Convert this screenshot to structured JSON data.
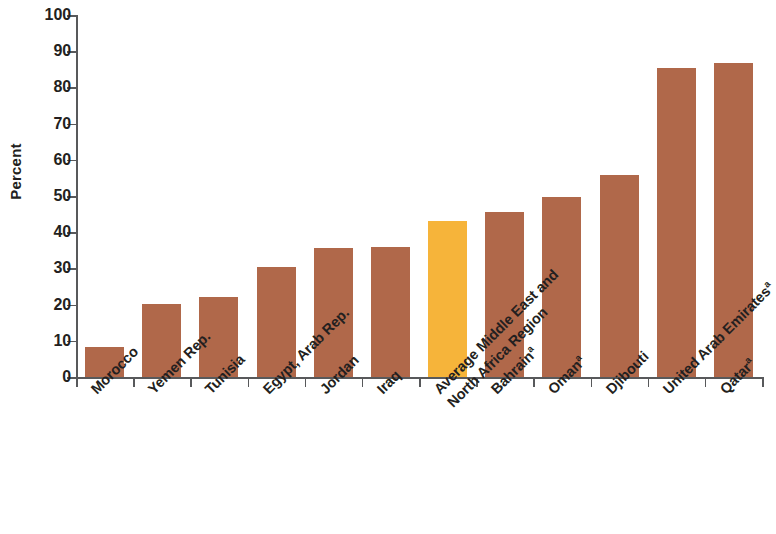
{
  "chart_data": {
    "type": "bar",
    "title": "",
    "xlabel": "",
    "ylabel": "Percent",
    "ylim": [
      0,
      100
    ],
    "ytick_values": [
      0,
      10,
      20,
      30,
      40,
      50,
      60,
      70,
      80,
      90,
      100
    ],
    "ytick_labels": [
      "0",
      "10",
      "20",
      "30",
      "40",
      "50",
      "60",
      "70",
      "80",
      "90",
      "100"
    ],
    "grid": false,
    "legend": null,
    "categories": [
      "Morocco",
      "Yemen Rep.",
      "Tunisia",
      "Egypt, Arab Rep.",
      "Jordan",
      "Iraq",
      "Average Middle East and North Africa Region",
      "Bahrain",
      "Oman",
      "Djibouti",
      "United Arab Emirates",
      "Qatar"
    ],
    "category_lines": [
      [
        "Morocco",
        ""
      ],
      [
        "Yemen Rep.",
        ""
      ],
      [
        "Tunisia",
        ""
      ],
      [
        "Egypt, Arab Rep.",
        ""
      ],
      [
        "Jordan",
        ""
      ],
      [
        "Iraq",
        ""
      ],
      [
        "Average Middle East and",
        "North Africa Region"
      ],
      [
        "Bahrain",
        ""
      ],
      [
        "Oman",
        ""
      ],
      [
        "Djibouti",
        ""
      ],
      [
        "United Arab Emirates",
        ""
      ],
      [
        "Qatar",
        ""
      ]
    ],
    "category_footnotes": [
      "",
      "",
      "",
      "",
      "",
      "",
      "",
      "a",
      "a",
      "",
      "a",
      "a"
    ],
    "values": [
      8.3,
      20.2,
      22.0,
      30.5,
      35.6,
      36.0,
      43.2,
      45.5,
      49.8,
      55.8,
      85.3,
      86.8
    ],
    "bar_colors": [
      "#b0684a",
      "#b0684a",
      "#b0684a",
      "#b0684a",
      "#b0684a",
      "#b0684a",
      "#f6b43a",
      "#b0684a",
      "#b0684a",
      "#b0684a",
      "#b0684a",
      "#b0684a"
    ],
    "highlight_index": 6,
    "colors": {
      "bar": "#b0684a",
      "highlight_bar": "#f6b43a",
      "axis": "#58595b",
      "text": "#231f20",
      "background": "#ffffff"
    }
  }
}
